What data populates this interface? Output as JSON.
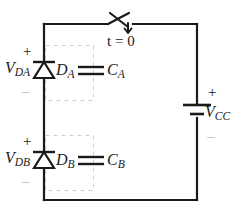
{
  "diagram": {
    "type": "electrical-schematic",
    "canvas": {
      "width": 244,
      "height": 222
    },
    "colors": {
      "wire": "#1a1a1a",
      "background": "#ffffff",
      "dashed_box": "#cfcfcf",
      "faint_sign": "#b9b9b9",
      "text": "#1a1a1a"
    }
  },
  "labels": {
    "switch_time": "t = 0",
    "v_da": {
      "base": "V",
      "sub": "DA"
    },
    "v_db": {
      "base": "V",
      "sub": "DB"
    },
    "v_cc": {
      "base": "V",
      "sub": "CC"
    },
    "diode_a": {
      "base": "D",
      "sub": "A"
    },
    "diode_b": {
      "base": "D",
      "sub": "B"
    },
    "cap_a": {
      "base": "C",
      "sub": "A"
    },
    "cap_b": {
      "base": "C",
      "sub": "B"
    },
    "plus": "+",
    "minus": "_"
  },
  "components": [
    {
      "name": "switch",
      "label": "t = 0",
      "kind": "spst-switch",
      "position": "top-rail"
    },
    {
      "name": "diode-a",
      "label": "DA",
      "kind": "diode",
      "orientation": "points-up",
      "position": "left-rail-upper"
    },
    {
      "name": "diode-b",
      "label": "DB",
      "kind": "diode",
      "orientation": "points-up",
      "position": "left-rail-lower"
    },
    {
      "name": "capacitor-a",
      "label": "CA",
      "kind": "capacitor",
      "position": "parallel-with-diode-a"
    },
    {
      "name": "capacitor-b",
      "label": "CB",
      "kind": "capacitor",
      "position": "parallel-with-diode-b"
    },
    {
      "name": "source-vcc",
      "label": "VCC",
      "kind": "dc-battery",
      "position": "right-rail"
    }
  ],
  "voltages": [
    {
      "name": "V_DA",
      "across": "diode-a",
      "plus_at": "top"
    },
    {
      "name": "V_DB",
      "across": "diode-b",
      "plus_at": "top"
    },
    {
      "name": "V_CC",
      "across": "source-vcc",
      "plus_at": "top"
    }
  ]
}
